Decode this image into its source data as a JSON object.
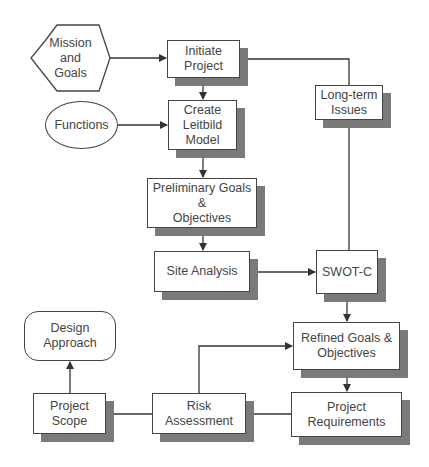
{
  "diagram": {
    "nodes": {
      "mission": {
        "label": "Mission\nand\nGoals",
        "shape": "hexagon"
      },
      "functions": {
        "label": "Functions",
        "shape": "ellipse"
      },
      "initiate": {
        "label": "Initiate\nProject",
        "shape": "box"
      },
      "leitbild": {
        "label": "Create\nLeitbild\nModel",
        "shape": "box"
      },
      "preliminary": {
        "label": "Preliminary Goals\n&\nObjectives",
        "shape": "box"
      },
      "site": {
        "label": "Site Analysis",
        "shape": "box"
      },
      "swot": {
        "label": "SWOT-C",
        "shape": "box"
      },
      "longterm": {
        "label": "Long-term\nIssues",
        "shape": "box"
      },
      "refined": {
        "label": "Refined Goals &\nObjectives",
        "shape": "box"
      },
      "requirements": {
        "label": "Project\nRequirements",
        "shape": "box"
      },
      "risk": {
        "label": "Risk\nAssessment",
        "shape": "box"
      },
      "scope": {
        "label": "Project\nScope",
        "shape": "box"
      },
      "design": {
        "label": "Design\nApproach",
        "shape": "rounded"
      }
    },
    "edges": [
      {
        "from": "mission",
        "to": "initiate"
      },
      {
        "from": "functions",
        "to": "leitbild"
      },
      {
        "from": "initiate",
        "to": "leitbild"
      },
      {
        "from": "leitbild",
        "to": "preliminary"
      },
      {
        "from": "preliminary",
        "to": "site"
      },
      {
        "from": "site",
        "to": "swot"
      },
      {
        "from": "swot",
        "to": "longterm"
      },
      {
        "from": "longterm",
        "to": "initiate"
      },
      {
        "from": "swot",
        "to": "refined"
      },
      {
        "from": "refined",
        "to": "requirements"
      },
      {
        "from": "requirements",
        "to": "risk"
      },
      {
        "from": "risk",
        "to": "refined"
      },
      {
        "from": "risk",
        "to": "scope"
      },
      {
        "from": "scope",
        "to": "design"
      }
    ],
    "colors": {
      "line": "#333333",
      "shadow": "#7a7a7a",
      "box": "#ffffff"
    }
  }
}
